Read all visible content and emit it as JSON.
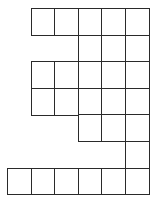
{
  "diagram": {
    "type": "grid-shape",
    "cell_width": 23.6,
    "cell_height": 26.6,
    "origin_x": 7,
    "origin_y": 8,
    "line_color": "#2a2a2a",
    "rows": [
      {
        "row": 0,
        "cols": [
          1,
          2,
          3,
          4,
          5
        ]
      },
      {
        "row": 1,
        "cols": [
          3,
          4,
          5
        ]
      },
      {
        "row": 2,
        "cols": [
          1,
          2,
          3,
          4,
          5
        ]
      },
      {
        "row": 3,
        "cols": [
          1,
          2,
          3,
          4,
          5
        ]
      },
      {
        "row": 4,
        "cols": [
          3,
          4,
          5
        ]
      },
      {
        "row": 5,
        "cols": [
          5
        ]
      },
      {
        "row": 6,
        "cols": [
          0,
          1,
          2,
          3,
          4,
          5
        ]
      }
    ]
  }
}
